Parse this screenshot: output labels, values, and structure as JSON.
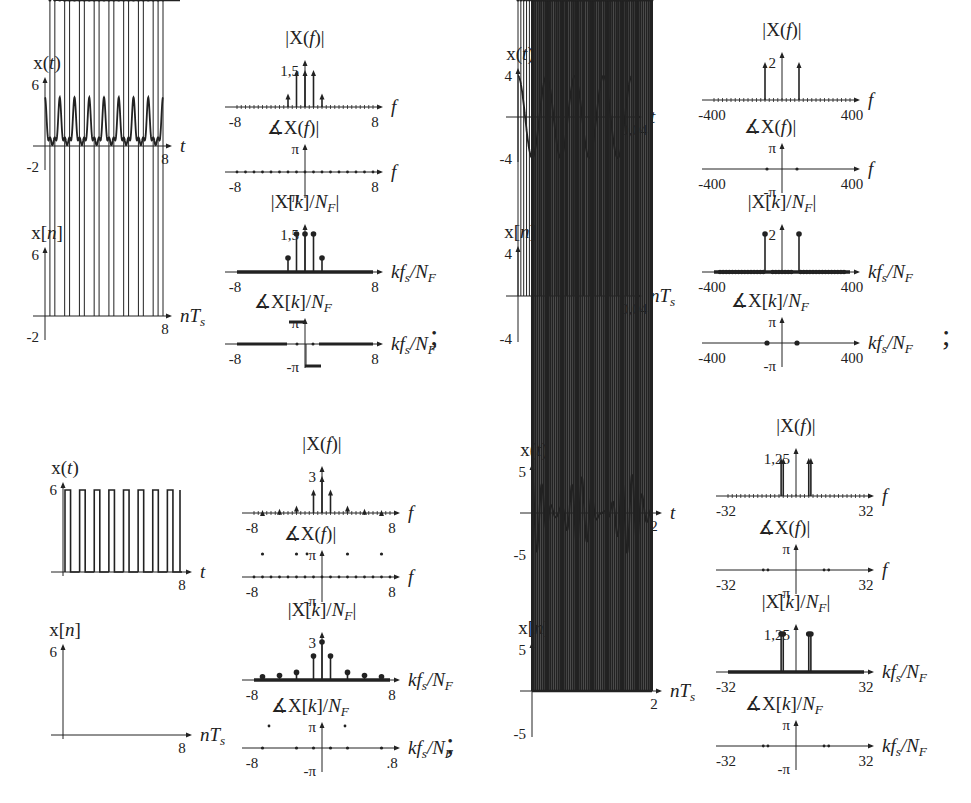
{
  "figure": {
    "separator": ";",
    "panels": [
      {
        "id": "A",
        "xt": {
          "title": "x(t)",
          "y_max_label": "6",
          "y_min_label": "-2",
          "x_end_label": "8",
          "x_axis": "t",
          "shape": "periodic-pulse",
          "periods": 8,
          "ymax": 6,
          "ymin": -2
        },
        "xn": {
          "title": "x[n]",
          "y_max_label": "6",
          "y_min_label": "-2",
          "x_end_label": "8",
          "x_axis": "nTs"
        },
        "mag_f": {
          "title": "|X(f)|",
          "peak_label": "1,5",
          "x_min": "-8",
          "x_max": "8",
          "x_axis": "f",
          "impulses": [
            [
              -2,
              0.55
            ],
            [
              -1,
              1.5
            ],
            [
              0,
              1.5
            ],
            [
              1,
              1.5
            ],
            [
              2,
              0.55
            ]
          ]
        },
        "phase_f": {
          "title": "∡X(f)|",
          "pi": "π",
          "neg_pi": "-π",
          "x_min": "-8",
          "x_max": "8",
          "x_axis": "f"
        },
        "mag_k": {
          "title": "|X[k]/N_F|",
          "peak_label": "1,5",
          "x_min": "-8",
          "x_max": "8",
          "x_axis": "kfs/NF"
        },
        "phase_k": {
          "title": "∡X[k]/N_F",
          "pi": "π",
          "neg_pi": "-π",
          "x_min": "-8",
          "x_max": "8",
          "x_axis": "kfs/NF"
        }
      },
      {
        "id": "B",
        "xt": {
          "title": "x(t)",
          "y_max_label": "4",
          "y_min_label": "-4",
          "x_end_label": "0,04",
          "x_axis": "t",
          "shape": "cosine",
          "periods": 4,
          "ymax": 4,
          "ymin": -4
        },
        "xn": {
          "title": "x[n]",
          "y_max_label": "4",
          "y_min_label": "-4",
          "x_end_label": "0,04",
          "x_axis": "nTs"
        },
        "mag_f": {
          "title": "|X(f)|",
          "peak_label": "2",
          "x_min": "-400",
          "x_max": "400",
          "x_axis": "f",
          "impulses": [
            [
              -100,
              2
            ],
            [
              100,
              2
            ]
          ]
        },
        "phase_f": {
          "title": "∡X(f)|",
          "pi": "π",
          "neg_pi": "-π",
          "x_min": "-400",
          "x_max": "400",
          "x_axis": "f"
        },
        "mag_k": {
          "title": "|X[k]/N_F|",
          "peak_label": "2",
          "x_min": "-400",
          "x_max": "400",
          "x_axis": "kfs/NF"
        },
        "phase_k": {
          "title": "∡X[k]/N_F",
          "pi": "π",
          "neg_pi": "-π",
          "x_min": "-400",
          "x_max": "400",
          "x_axis": "kfs/NF"
        }
      },
      {
        "id": "C",
        "xt": {
          "title": "x(t)",
          "y_max_label": "6",
          "y_min_label": "",
          "x_end_label": "8",
          "x_axis": "t",
          "shape": "square",
          "periods": 8,
          "ymax": 6,
          "ymin": 0
        },
        "xn": {
          "title": "x[n]",
          "y_max_label": "6",
          "y_min_label": "",
          "x_end_label": "8",
          "x_axis": "nTs"
        },
        "mag_f": {
          "title": "|X(f)|",
          "peak_label": "3",
          "x_min": "-8",
          "x_max": "8",
          "x_axis": "f",
          "impulses": [
            [
              0,
              3
            ],
            [
              -1,
              1.9
            ],
            [
              1,
              1.9
            ],
            [
              -3,
              0.6
            ],
            [
              3,
              0.6
            ],
            [
              -5,
              0.35
            ],
            [
              5,
              0.35
            ],
            [
              -7,
              0.25
            ],
            [
              7,
              0.25
            ]
          ]
        },
        "phase_f": {
          "title": "∡X(f)|",
          "pi": "π",
          "neg_pi": "-π",
          "x_min": "-8",
          "x_max": "8",
          "x_axis": "f"
        },
        "mag_k": {
          "title": "|X[k]/N_F|",
          "peak_label": "3",
          "x_min": "-8",
          "x_max": "8",
          "x_axis": "kfs/NF"
        },
        "phase_k": {
          "title": "∡X[k]/N_F",
          "pi": "π",
          "neg_pi": "-π",
          "x_min": "-8",
          "x_max": ".8",
          "x_axis": "kfs/NF"
        }
      },
      {
        "id": "D",
        "xt": {
          "title": "x(t)",
          "y_max_label": "5",
          "y_min_label": "-5",
          "x_end_label": "2",
          "x_axis": "t",
          "shape": "beat",
          "ymax": 5,
          "ymin": -5
        },
        "xn": {
          "title": "x[n]",
          "y_max_label": "5",
          "y_min_label": "-5",
          "x_end_label": "2",
          "x_axis": "nTs"
        },
        "mag_f": {
          "title": "|X(f)|",
          "peak_label": "1,25",
          "x_min": "-32",
          "x_max": "32",
          "x_axis": "f",
          "impulses": [
            [
              -7,
              1.25
            ],
            [
              -6,
              1.25
            ],
            [
              6,
              1.25
            ],
            [
              7,
              1.25
            ]
          ]
        },
        "phase_f": {
          "title": "∡X(f)|",
          "pi": "π",
          "neg_pi": "-π",
          "x_min": "-32",
          "x_max": "32",
          "x_axis": "f"
        },
        "mag_k": {
          "title": "|X[k]/N_F|",
          "peak_label": "1,25",
          "x_min": "-32",
          "x_max": "32",
          "x_axis": "kfs/NF"
        },
        "phase_k": {
          "title": "∡X[k]/N_F",
          "pi": "π",
          "neg_pi": "-π",
          "x_min": "-32",
          "x_max": "32",
          "x_axis": "kfs/NF"
        }
      }
    ]
  }
}
